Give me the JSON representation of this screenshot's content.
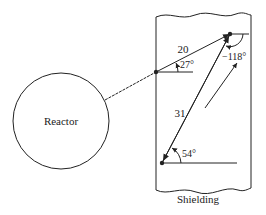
{
  "diagram": {
    "reactor_label": "Reactor",
    "shielding_label": "Shielding",
    "vectors": [
      {
        "label": "20",
        "angle_label": "27°"
      },
      {
        "label": "31",
        "angle_label": "54°"
      },
      {
        "label": "",
        "angle_label": "−118°"
      }
    ]
  },
  "colors": {
    "line": "#222222",
    "background": "#ffffff"
  }
}
